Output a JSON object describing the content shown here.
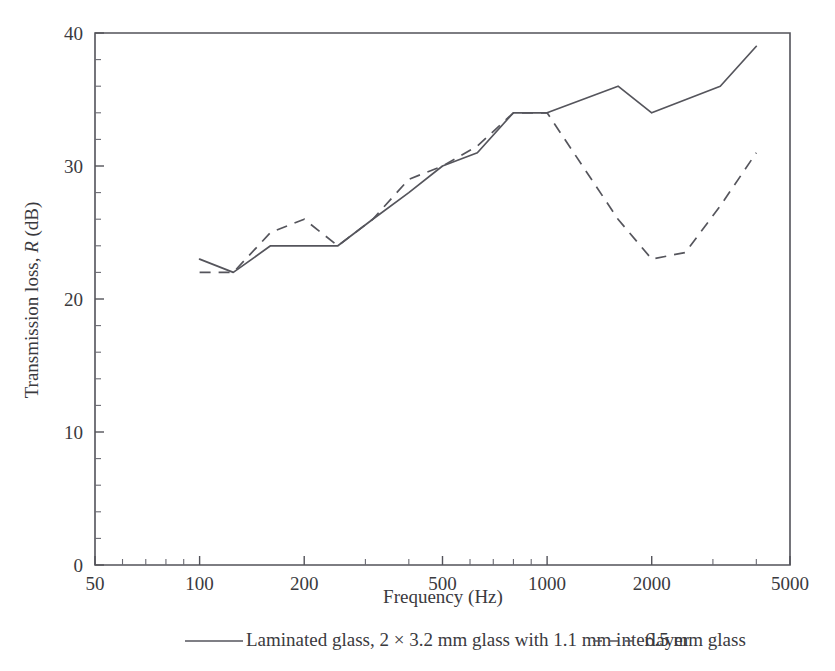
{
  "chart_data": {
    "type": "line",
    "title": "",
    "xlabel": "Frequency (Hz)",
    "ylabel": "Transmission loss, R (dB)",
    "ylabel_parts": {
      "pre": "Transmission loss, ",
      "italic": "R",
      "post": " (dB)"
    },
    "xscale": "log",
    "yscale": "linear",
    "xlim": [
      50,
      5000
    ],
    "ylim": [
      0,
      40
    ],
    "grid": false,
    "legend_position": "below",
    "x_tick_labels": [
      "50",
      "100",
      "200",
      "500",
      "1000",
      "2000",
      "5000"
    ],
    "x_tick_values": [
      50,
      100,
      200,
      500,
      1000,
      2000,
      5000
    ],
    "y_tick_labels": [
      "0",
      "10",
      "20",
      "30",
      "40"
    ],
    "y_tick_values": [
      0,
      10,
      20,
      30,
      40
    ],
    "y_minor_step": 2,
    "series": [
      {
        "name": "Laminated glass, 2 × 3.2 mm glass with 1.1 mm interlayer",
        "style": "solid",
        "color": "#55555c",
        "x": [
          100,
          125,
          160,
          250,
          315,
          400,
          500,
          630,
          800,
          1000,
          1600,
          2000,
          3150,
          4000
        ],
        "y": [
          23,
          22,
          24,
          24,
          26,
          28,
          30,
          31,
          34,
          34,
          36,
          34,
          36,
          39
        ]
      },
      {
        "name": "6.5 mm glass",
        "style": "dashed",
        "color": "#55555c",
        "x": [
          100,
          125,
          160,
          200,
          250,
          315,
          400,
          500,
          630,
          800,
          1000,
          1600,
          2000,
          2500,
          3150,
          4000
        ],
        "y": [
          22,
          22,
          25,
          26,
          24,
          26,
          29,
          30,
          31.5,
          34,
          34,
          26,
          23,
          23.5,
          27,
          31
        ]
      }
    ]
  },
  "legend": {
    "entries": [
      {
        "label": "Laminated glass, 2 × 3.2 mm glass with 1.1 mm interlayer",
        "style": "solid"
      },
      {
        "label": "6.5 mm glass",
        "style": "dashed"
      }
    ]
  },
  "colors": {
    "ink": "#2e2e30",
    "axis": "#53535a",
    "line": "#55555c",
    "background": "#ffffff"
  }
}
